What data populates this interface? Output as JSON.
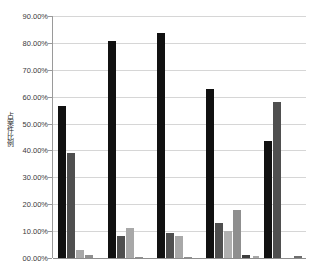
{
  "chart_data": {
    "type": "bar",
    "title": "",
    "xlabel": "",
    "ylabel": "占案件比例",
    "ylim": [
      0,
      0.9
    ],
    "grid": true,
    "legend": "none",
    "y_tick_labels": [
      "90.00%",
      "80.00%",
      "70.00%",
      "60.00%",
      "50.00%",
      "40.00%",
      "30.00%",
      "20.00%",
      "10.00%",
      "00.00%"
    ],
    "y_tick_values": [
      0.9,
      0.8,
      0.7,
      0.6,
      0.5,
      0.4,
      0.3,
      0.2,
      0.1,
      0.0
    ],
    "categories": [
      "1",
      "2",
      "3",
      "4",
      "5"
    ],
    "series": [
      {
        "name": "series-1",
        "color": "#111111",
        "values": [
          0.565,
          0.808,
          0.838,
          0.628,
          0.435
        ]
      },
      {
        "name": "series-2",
        "color": "#4f4f4f",
        "values": [
          0.39,
          0.081,
          0.094,
          0.131,
          0.58
        ]
      },
      {
        "name": "series-3",
        "color": "#a8a8a8",
        "values": [
          0.03,
          0.113,
          0.081,
          0.099,
          0.008
        ]
      },
      {
        "name": "series-4",
        "color": "#8f8f8f",
        "values": [
          0.01,
          0.004,
          0.004,
          0.18,
          0.006
        ]
      },
      {
        "name": "series-5",
        "color": "#6e6e6e",
        "values": [
          0.0,
          0.0,
          0.0,
          0.012,
          0.0
        ]
      }
    ],
    "bars": [
      {
        "group": 1,
        "series": "series-1",
        "value": 0.565,
        "color": "#111111",
        "x": 57,
        "width": 8
      },
      {
        "group": 1,
        "series": "series-2",
        "value": 0.39,
        "color": "#4f4f4f",
        "x": 66,
        "width": 8
      },
      {
        "group": 1,
        "series": "series-3",
        "value": 0.03,
        "color": "#a8a8a8",
        "x": 75,
        "width": 8
      },
      {
        "group": 1,
        "series": "series-4",
        "value": 0.01,
        "color": "#8f8f8f",
        "x": 84,
        "width": 8
      },
      {
        "group": 2,
        "series": "series-1",
        "value": 0.808,
        "color": "#111111",
        "x": 107,
        "width": 8
      },
      {
        "group": 2,
        "series": "series-2",
        "value": 0.081,
        "color": "#4f4f4f",
        "x": 116,
        "width": 8
      },
      {
        "group": 2,
        "series": "series-3",
        "value": 0.113,
        "color": "#a8a8a8",
        "x": 125,
        "width": 8
      },
      {
        "group": 2,
        "series": "series-4",
        "value": 0.004,
        "color": "#8f8f8f",
        "x": 134,
        "width": 8
      },
      {
        "group": 3,
        "series": "series-1",
        "value": 0.838,
        "color": "#111111",
        "x": 156,
        "width": 8
      },
      {
        "group": 3,
        "series": "series-2",
        "value": 0.094,
        "color": "#4f4f4f",
        "x": 165,
        "width": 8
      },
      {
        "group": 3,
        "series": "series-3",
        "value": 0.081,
        "color": "#a8a8a8",
        "x": 174,
        "width": 8
      },
      {
        "group": 3,
        "series": "series-4",
        "value": 0.004,
        "color": "#8f8f8f",
        "x": 183,
        "width": 8
      },
      {
        "group": 4,
        "series": "series-1",
        "value": 0.628,
        "color": "#111111",
        "x": 205,
        "width": 8
      },
      {
        "group": 4,
        "series": "series-2",
        "value": 0.131,
        "color": "#4f4f4f",
        "x": 214,
        "width": 8
      },
      {
        "group": 4,
        "series": "series-3",
        "value": 0.099,
        "color": "#b0b0b0",
        "x": 223,
        "width": 8
      },
      {
        "group": 4,
        "series": "series-4",
        "value": 0.18,
        "color": "#8f8f8f",
        "x": 232,
        "width": 8
      },
      {
        "group": 4,
        "series": "series-5",
        "value": 0.012,
        "color": "#3d3d3d",
        "x": 241,
        "width": 8
      },
      {
        "group": 5,
        "series": "series-1",
        "value": 0.435,
        "color": "#111111",
        "x": 263,
        "width": 8
      },
      {
        "group": 5,
        "series": "series-2",
        "value": 0.58,
        "color": "#4f4f4f",
        "x": 272,
        "width": 8
      },
      {
        "group": 5,
        "series": "series-3",
        "value": 0.008,
        "color": "#a8a8a8",
        "x": 252,
        "width": 6
      },
      {
        "group": 5,
        "series": "series-4",
        "value": 0.006,
        "color": "#6e6e6e",
        "x": 293,
        "width": 8
      }
    ]
  },
  "axis": {
    "plot_left": 52,
    "plot_top": 16,
    "plot_width": 253,
    "plot_height": 242
  }
}
